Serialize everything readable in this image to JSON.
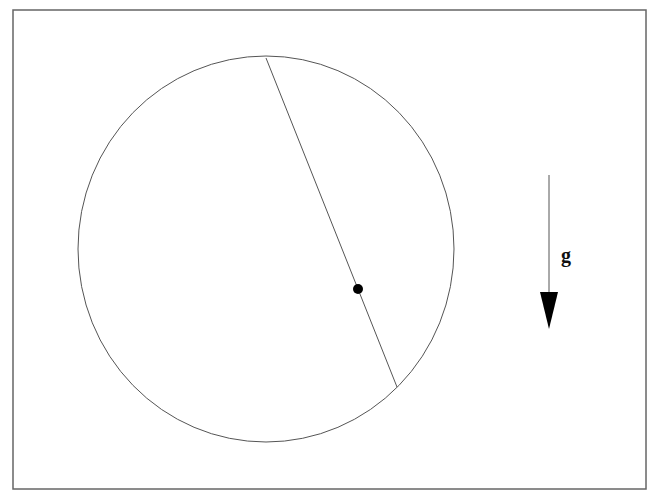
{
  "diagram": {
    "frame": {
      "x": 13,
      "y": 10,
      "width": 633,
      "height": 479,
      "stroke": "#666666"
    },
    "circle": {
      "cx": 266,
      "cy": 249,
      "rx": 188,
      "ry": 193,
      "stroke": "#555555"
    },
    "chord": {
      "x1": 266,
      "y1": 58,
      "x2": 397,
      "y2": 387,
      "stroke": "#555555"
    },
    "point": {
      "cx": 358,
      "cy": 289,
      "r": 5,
      "fill": "#000000"
    },
    "gravity_arrow": {
      "x": 549,
      "y_start": 175,
      "y_end": 329,
      "color": "#000000"
    },
    "gravity_label": "g"
  }
}
